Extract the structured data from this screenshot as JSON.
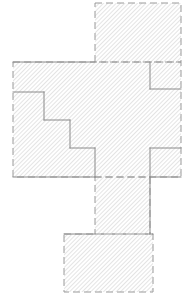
{
  "figure": {
    "canvas": {
      "width": 187,
      "height": 301,
      "background": "#ffffff"
    },
    "style": {
      "hatch_color": "#b0b0b0",
      "hatch_angle_deg": 45,
      "hatch_spacing_px": 3,
      "hatch_stroke_width": 0.7,
      "fill_color": "#ffffff",
      "outline_color": "#9a9a9a",
      "outline_width": 1,
      "outline_dash": "7 4",
      "internal_line_color": "#8a8a8a",
      "internal_line_width": 1,
      "internal_line_dash": "none"
    },
    "shapes": [
      {
        "id": "upper-block",
        "name": "upper-rectangle",
        "kind": "rectangle",
        "x": 95,
        "y": 3,
        "width": 86,
        "height": 59,
        "border": "dashed",
        "hatched": true
      },
      {
        "id": "main-block",
        "name": "main-body-rectangle",
        "kind": "rectangle",
        "x": 13,
        "y": 62,
        "width": 168,
        "height": 115,
        "border": "dashed",
        "hatched": true
      },
      {
        "id": "lower-strip",
        "name": "lower-vertical-strip",
        "kind": "rectangle",
        "x": 95,
        "y": 177,
        "width": 55,
        "height": 57,
        "border": "dashed",
        "hatched": true
      },
      {
        "id": "bottom-block",
        "name": "bottom-rectangle",
        "kind": "rectangle",
        "x": 64,
        "y": 234,
        "width": 89,
        "height": 58,
        "border": "dashed",
        "hatched": true
      }
    ],
    "internal_lines": [
      {
        "id": "stair-h1",
        "name": "staircase-horizontal-1",
        "x1": 13,
        "y1": 92,
        "x2": 44,
        "y2": 92
      },
      {
        "id": "stair-v1",
        "name": "staircase-vertical-1",
        "x1": 44,
        "y1": 92,
        "x2": 44,
        "y2": 120
      },
      {
        "id": "stair-h2",
        "name": "staircase-horizontal-2",
        "x1": 44,
        "y1": 120,
        "x2": 70,
        "y2": 120
      },
      {
        "id": "stair-v2",
        "name": "staircase-vertical-2",
        "x1": 70,
        "y1": 120,
        "x2": 70,
        "y2": 148
      },
      {
        "id": "stair-h3",
        "name": "staircase-horizontal-3",
        "x1": 70,
        "y1": 148,
        "x2": 95,
        "y2": 148
      },
      {
        "id": "stair-v3",
        "name": "staircase-vertical-3",
        "x1": 95,
        "y1": 148,
        "x2": 95,
        "y2": 177
      },
      {
        "id": "notch-tr-v",
        "name": "top-right-notch-vertical",
        "x1": 150,
        "y1": 62,
        "x2": 150,
        "y2": 89
      },
      {
        "id": "notch-tr-h",
        "name": "top-right-notch-horizontal",
        "x1": 150,
        "y1": 89,
        "x2": 181,
        "y2": 89
      },
      {
        "id": "notch-br-v",
        "name": "bottom-right-notch-vertical",
        "x1": 150,
        "y1": 148,
        "x2": 150,
        "y2": 177
      },
      {
        "id": "notch-br-h",
        "name": "bottom-right-notch-horizontal",
        "x1": 150,
        "y1": 148,
        "x2": 181,
        "y2": 148
      },
      {
        "id": "strip-right",
        "name": "lower-strip-right-edge",
        "x1": 150,
        "y1": 177,
        "x2": 150,
        "y2": 234
      },
      {
        "id": "main-top-left",
        "name": "main-body-top-left-edge",
        "x1": 13,
        "y1": 62,
        "x2": 95,
        "y2": 62
      },
      {
        "id": "main-bottom-left",
        "name": "main-body-bottom-left-edge",
        "x1": 13,
        "y1": 177,
        "x2": 95,
        "y2": 177
      },
      {
        "id": "main-bottom-right",
        "name": "main-body-bottom-right-edge",
        "x1": 150,
        "y1": 177,
        "x2": 181,
        "y2": 177
      },
      {
        "id": "bottom-top-left",
        "name": "bottom-block-top-left-edge",
        "x1": 64,
        "y1": 234,
        "x2": 95,
        "y2": 234
      },
      {
        "id": "bottom-top-right",
        "name": "bottom-block-top-right-edge",
        "x1": 150,
        "y1": 234,
        "x2": 153,
        "y2": 234
      }
    ]
  }
}
